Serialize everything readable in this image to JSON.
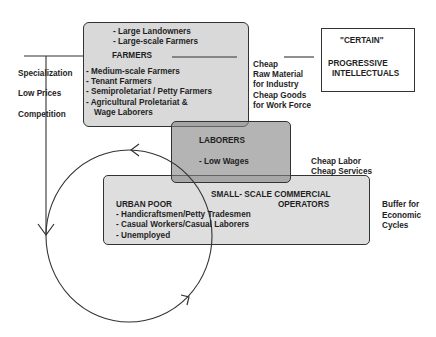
{
  "farmers_box": {
    "top_items": [
      "- Large Landowners",
      "- Large-scale Farmers"
    ],
    "title": "FARMERS",
    "items": [
      "- Medium-scale Farmers",
      "- Tenant Farmers",
      "- Semiproletariat / Petty Farmers",
      "- Agricultural Proletariat &",
      "  Wage Laborers"
    ]
  },
  "intellectuals_box": {
    "quote": "\"CERTAIN\"",
    "title_line1": "PROGRESSIVE",
    "title_line2": "INTELLECTUALS"
  },
  "left_labels": [
    "Specialization",
    "Low Prices",
    "Competition"
  ],
  "farmers_outputs": [
    "Cheap",
    "Raw Material",
    "for Industry",
    "Cheap Goods",
    "for Work Force"
  ],
  "laborers_box": {
    "title": "LABORERS",
    "item": "-  Low Wages"
  },
  "laborers_outputs": [
    "Cheap Labor",
    "Cheap Services"
  ],
  "commercial_box": {
    "title_line1": "SMALL- SCALE COMMERCIAL",
    "title_line2": "OPERATORS",
    "urban_title": "URBAN POOR",
    "urban_items": [
      "- Handicraftsmen/Petty Tradesmen",
      "- Casual Workers/Casual Laborers",
      "- Unemployed"
    ]
  },
  "commercial_output": [
    "Buffer for",
    "Economic",
    "Cycles"
  ],
  "colors": {
    "farmers_fill": "#d9d9d9",
    "laborers_fill": "#a6a6a6",
    "commercial_fill": "#dedede",
    "line": "#333333"
  }
}
